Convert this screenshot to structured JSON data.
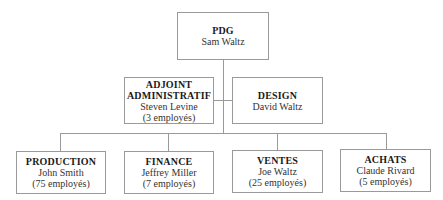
{
  "ceo": {
    "title": "PDG",
    "name": "Sam Waltz"
  },
  "staff": [
    {
      "title_line1": "ADJOINT",
      "title_line2": "ADMINISTRATIF",
      "name": "Steven Levine",
      "count": "(3 employés)"
    },
    {
      "title": "DESIGN",
      "name": "David Waltz"
    }
  ],
  "departments": [
    {
      "title": "PRODUCTION",
      "name": "John Smith",
      "count": "(75 employés)"
    },
    {
      "title": "FINANCE",
      "name": "Jeffrey Miller",
      "count": "(7 employés)"
    },
    {
      "title": "VENTES",
      "name": "Joe Waltz",
      "count": "(25 employés)"
    },
    {
      "title": "ACHATS",
      "name": "Claude Rivard",
      "count": "(5 employés)"
    }
  ]
}
